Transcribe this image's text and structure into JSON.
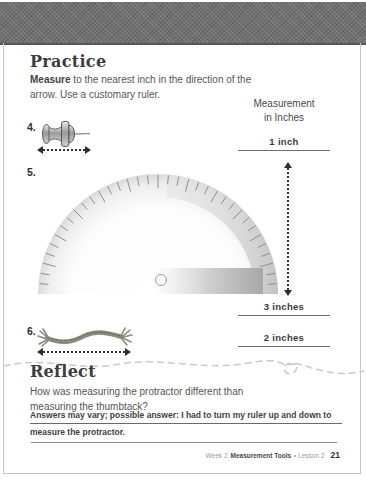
{
  "page": {
    "practice_heading": "Practice",
    "instructions": {
      "bold": "Measure",
      "line1_rest": " to the nearest inch in the direction of the",
      "line2": "arrow. Use a customary ruler."
    },
    "measurement_header": {
      "line1": "Measurement",
      "line2": "in Inches"
    },
    "items": [
      {
        "number": "4.",
        "object": "thumbtack",
        "answer": "1 inch"
      },
      {
        "number": "5.",
        "object": "protractor",
        "answer": "3 inches"
      },
      {
        "number": "6.",
        "object": "string",
        "answer": "2 inches"
      }
    ],
    "reflect_heading": "Reflect",
    "reflect_question": {
      "line1": "How was measuring the protractor different than",
      "line2": "measuring the thumbtack?"
    },
    "reflect_answer": {
      "line1": "Answers may vary; possible answer: I had to turn my ruler up and down to",
      "line2": "measure the protractor."
    },
    "footer": {
      "week": "Week 2",
      "program": "Measurement Tools",
      "lesson": "• Lesson 2",
      "page_number": "21"
    }
  },
  "colors": {
    "top_bar": "#717171",
    "page_border": "#c6c6c6",
    "heading_text": "#3d3d3d",
    "body_text": "#565656",
    "answer_text": "#3a3a3a",
    "rule_line": "#6e6e6e",
    "arrow": "#2e2e2e",
    "squiggle": "#c9c9c9",
    "protractor_gray": "#c9c9c9",
    "string": "#8b897e"
  }
}
